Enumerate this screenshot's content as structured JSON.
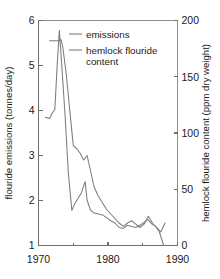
{
  "chart_data": {
    "type": "line",
    "title": "",
    "xlabel": "",
    "ylabel": "flouride emissions (tonnes/day)",
    "y2label": "hemlock flouride content (ppm dry weight)",
    "grid": false,
    "legend_position": "top-center",
    "xlim": [
      1970,
      1990
    ],
    "ylim": [
      1,
      6
    ],
    "y2lim": [
      0,
      200
    ],
    "xticks": [
      1970,
      1980,
      1990
    ],
    "xtick_labels": [
      "1970",
      "1980",
      "1990"
    ],
    "xticks_minor": [
      1975,
      1985
    ],
    "yticks": [
      1,
      2,
      3,
      4,
      5,
      6
    ],
    "ytick_labels": [
      "1",
      "2",
      "3",
      "4",
      "5",
      "6"
    ],
    "y2ticks": [
      0,
      50,
      100,
      150,
      200
    ],
    "y2tick_labels": [
      "0",
      "50",
      "100",
      "150",
      "200"
    ],
    "series": [
      {
        "name": "emissions",
        "axis": "left",
        "units": "tonnes/day",
        "color": "#7c7c7c",
        "x": [
          1971.0,
          1971.6,
          1972.0,
          1972.35,
          1972.7,
          1973.0,
          1973.35,
          1973.8,
          1974.3,
          1974.8,
          1975.2,
          1975.7,
          1976.2,
          1976.7,
          1977.0,
          1977.5,
          1978.0,
          1978.6,
          1979.2,
          1979.8,
          1980.4,
          1981.0,
          1981.6,
          1982.2,
          1982.8,
          1983.4,
          1984.0,
          1984.6,
          1985.1,
          1985.7,
          1986.3,
          1986.9,
          1987.4,
          1988.0
        ],
        "y": [
          3.85,
          3.82,
          3.95,
          4.02,
          5.05,
          5.78,
          5.0,
          3.95,
          2.6,
          1.78,
          1.92,
          2.05,
          2.18,
          2.42,
          2.0,
          1.78,
          1.72,
          1.7,
          1.68,
          1.62,
          1.55,
          1.5,
          1.4,
          1.38,
          1.45,
          1.42,
          1.4,
          1.45,
          1.5,
          1.58,
          1.48,
          1.42,
          1.3,
          1.0
        ]
      },
      {
        "name": "hemlock flouride content",
        "axis": "right",
        "units": "ppm dry weight",
        "color": "#7c7c7c",
        "x": [
          1971.6,
          1972.3,
          1972.9,
          1973.25,
          1973.5,
          1974.0,
          1974.5,
          1975.0,
          1975.5,
          1976.0,
          1976.5,
          1977.0,
          1977.5,
          1978.0,
          1978.6,
          1979.2,
          1979.8,
          1980.4,
          1981.0,
          1981.6,
          1982.2,
          1982.8,
          1983.4,
          1984.0,
          1984.6,
          1985.2,
          1985.8,
          1986.4,
          1987.0,
          1987.6,
          1988.2
        ],
        "y": [
          182.0,
          182.0,
          182.0,
          183.0,
          176.0,
          152.0,
          120.0,
          89.0,
          86.0,
          82.0,
          76.0,
          80.0,
          66.0,
          52.0,
          44.0,
          38.0,
          32.0,
          28.0,
          24.0,
          20.0,
          17.0,
          20.0,
          22.0,
          19.0,
          16.0,
          19.0,
          26.0,
          20.0,
          16.0,
          12.0,
          20.0
        ]
      }
    ],
    "legend": [
      {
        "label": "emissions"
      },
      {
        "label": "hemlock flouride"
      },
      {
        "label": "content"
      }
    ]
  }
}
